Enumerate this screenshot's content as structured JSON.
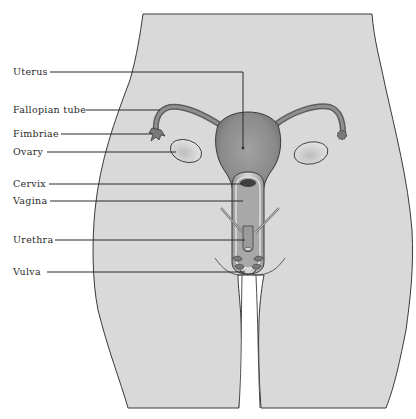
{
  "diagram": {
    "colors": {
      "body_fill": "#d9d9d9",
      "outline": "#3a3a3a",
      "organ_fill": "#8f8f8f",
      "organ_dark": "#5e5e5e",
      "leader_line": "#2a2a2a",
      "label_text": "#2a2a2a"
    },
    "labels": [
      {
        "id": "uterus",
        "text": "Uterus",
        "x": 13,
        "y": 67
      },
      {
        "id": "fallopian-tube",
        "text": "Fallopian tube",
        "x": 13,
        "y": 105
      },
      {
        "id": "fimbriae",
        "text": "Fimbriae",
        "x": 13,
        "y": 128
      },
      {
        "id": "ovary",
        "text": "Ovary",
        "x": 13,
        "y": 147
      },
      {
        "id": "cervix",
        "text": "Cervix",
        "x": 13,
        "y": 178
      },
      {
        "id": "vagina",
        "text": "Vagina",
        "x": 13,
        "y": 195
      },
      {
        "id": "urethra",
        "text": "Urethra",
        "x": 13,
        "y": 234
      },
      {
        "id": "vulva",
        "text": "Vulva",
        "x": 13,
        "y": 266
      }
    ]
  }
}
